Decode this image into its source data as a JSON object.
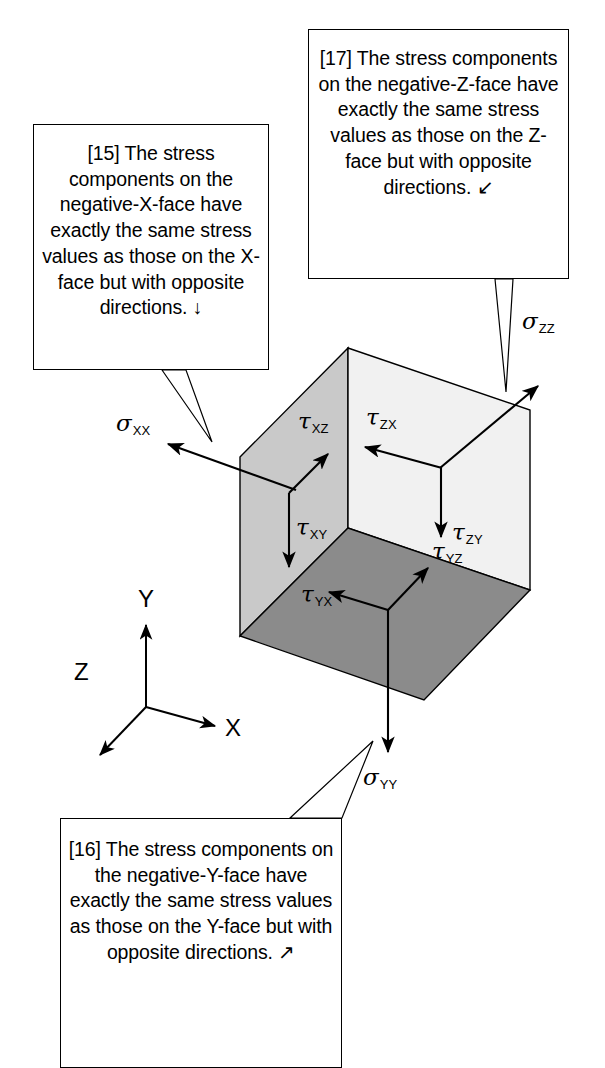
{
  "figure": {
    "background_color": "#ffffff",
    "line_color": "#000000"
  },
  "callouts": [
    {
      "id": "15",
      "name": "callout-15",
      "text": "[15] The stress components on the negative-X-face have exactly the same stress values as those on the X-face but with opposite directions. ↓",
      "arrow_glyph": "↓",
      "points_to": "negative-X-face"
    },
    {
      "id": "16",
      "name": "callout-16",
      "text": "[16] The stress components on the negative-Y-face have exactly the same stress values as those on the Y-face but with opposite directions. ↗",
      "arrow_glyph": "↗",
      "points_to": "negative-Y-face"
    },
    {
      "id": "17",
      "name": "callout-17",
      "text": "[17] The stress components on the negative-Z-face have exactly the same stress values as those on the Z-face but with opposite directions. ↙",
      "arrow_glyph": "↙",
      "points_to": "negative-Z-face"
    }
  ],
  "cube": {
    "faces": [
      {
        "name": "x-face",
        "label": "X-face",
        "fill": "#c9c9c9",
        "stroke": "#000000"
      },
      {
        "name": "z-face",
        "label": "Z-face",
        "fill": "#f1f1f1",
        "stroke": "#000000"
      },
      {
        "name": "y-face",
        "label": "Y-face",
        "fill": "#8b8b8b",
        "stroke": "#000000"
      }
    ]
  },
  "stress_labels": {
    "sigma_xx": {
      "symbol": "σ",
      "subscript": "XX",
      "face": "x-face",
      "type": "normal",
      "direction": "out of X-face, pointing left"
    },
    "tau_xy": {
      "symbol": "τ",
      "subscript": "XY",
      "face": "x-face",
      "type": "shear",
      "direction": "down"
    },
    "tau_xz": {
      "symbol": "τ",
      "subscript": "XZ",
      "face": "x-face",
      "type": "shear",
      "direction": "up-right"
    },
    "sigma_zz": {
      "symbol": "σ",
      "subscript": "ZZ",
      "face": "z-face",
      "type": "normal",
      "direction": "out of Z-face, up-right"
    },
    "tau_zx": {
      "symbol": "τ",
      "subscript": "ZX",
      "face": "z-face",
      "type": "shear",
      "direction": "left"
    },
    "tau_zy": {
      "symbol": "τ",
      "subscript": "ZY",
      "face": "z-face",
      "type": "shear",
      "direction": "down"
    },
    "sigma_yy": {
      "symbol": "σ",
      "subscript": "YY",
      "face": "y-face",
      "type": "normal",
      "direction": "out of Y-face, down"
    },
    "tau_yx": {
      "symbol": "τ",
      "subscript": "YX",
      "face": "y-face",
      "type": "shear",
      "direction": "left"
    },
    "tau_yz": {
      "symbol": "τ",
      "subscript": "YZ",
      "face": "y-face",
      "type": "shear",
      "direction": "up-right"
    }
  },
  "axes": {
    "name": "coordinate-triad",
    "x": "X",
    "y": "Y",
    "z": "Z"
  }
}
